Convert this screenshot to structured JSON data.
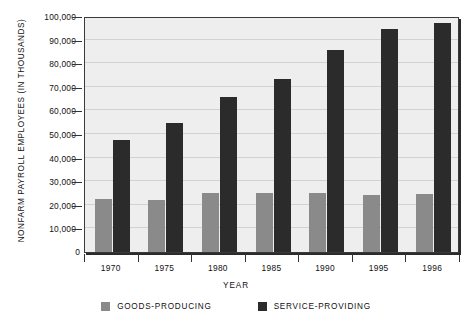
{
  "chart_data": {
    "type": "bar",
    "title": "",
    "xlabel": "Year",
    "ylabel": "Nonfarm Payroll Employees (in thousands)",
    "categories": [
      "1970",
      "1975",
      "1980",
      "1985",
      "1990",
      "1995",
      "1996"
    ],
    "series": [
      {
        "name": "Goods-Producing",
        "color": "#8a8a8a",
        "values": [
          22500,
          22000,
          25000,
          24800,
          24800,
          24300,
          24500
        ]
      },
      {
        "name": "Service-Providing",
        "color": "#2b2b2b",
        "values": [
          47500,
          54500,
          65500,
          73500,
          85500,
          94500,
          97000
        ]
      }
    ],
    "ylim": [
      0,
      100000
    ],
    "ytick_values": [
      0,
      10000,
      20000,
      30000,
      40000,
      50000,
      60000,
      70000,
      80000,
      90000,
      100000
    ],
    "ytick_labels": [
      "0",
      "10,000",
      "20,000",
      "30,000",
      "40,000",
      "50,000",
      "60,000",
      "70,000",
      "80,000",
      "90,000",
      "100,000"
    ],
    "grid": true,
    "legend_position": "bottom"
  },
  "axes": {
    "y_title": "NONFARM PAYROLL EMPLOYEES (IN THOUSANDS)",
    "x_title": "YEAR",
    "zero_label": "0"
  },
  "legend": {
    "items": [
      {
        "label": "GOODS-PRODUCING",
        "color": "#8a8a8a"
      },
      {
        "label": "SERVICE-PROVIDING",
        "color": "#2b2b2b"
      }
    ]
  }
}
